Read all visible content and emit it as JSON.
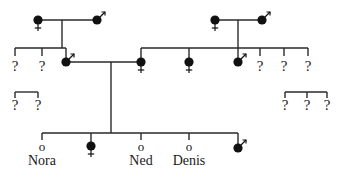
{
  "diagram": {
    "type": "pedigree",
    "colors": {
      "line": "#2a2a2a",
      "filled": "#111111",
      "text": "#1a1a1a",
      "background": "#ffffff"
    },
    "unknown_symbol": "?",
    "open_symbol": "o",
    "generations": {
      "grandparents_left": {
        "female": "filled-female",
        "male": "filled-male"
      },
      "grandparents_right": {
        "female": "filled-female",
        "male": "filled-male"
      },
      "children_left": [
        "?",
        "?",
        "filled-male"
      ],
      "children_right": [
        "filled-female",
        "filled-female",
        "filled-male",
        "?",
        "?",
        "?"
      ],
      "bracket_left": [
        "?",
        "?"
      ],
      "bracket_right": [
        "?",
        "?",
        "?"
      ],
      "offspring": [
        {
          "symbol": "o",
          "name": "Nora"
        },
        {
          "symbol": "filled-female",
          "name": ""
        },
        {
          "symbol": "o",
          "name": "Ned"
        },
        {
          "symbol": "o",
          "name": "Denis"
        },
        {
          "symbol": "filled-male",
          "name": ""
        }
      ]
    },
    "labels": {
      "q": "?",
      "o": "o",
      "nora": "Nora",
      "ned": "Ned",
      "denis": "Denis"
    }
  }
}
